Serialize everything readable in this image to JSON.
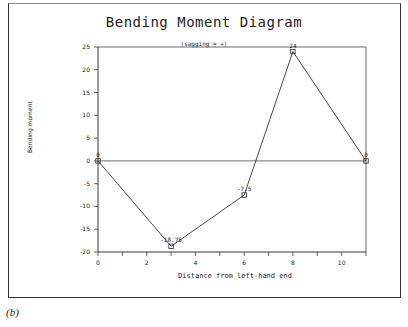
{
  "chart_data": {
    "type": "line",
    "title": "Bending Moment Diagram",
    "subtitle": "(sagging = +)",
    "xlabel": "Distance from left-hand end",
    "ylabel": "Bending moment",
    "x": [
      0,
      3,
      6,
      8,
      11
    ],
    "values": [
      0,
      -18.75,
      -7.5,
      24,
      0
    ],
    "point_labels": [
      "0",
      "-18.75",
      "-7.5",
      "24",
      "0"
    ],
    "xlim": [
      0,
      11
    ],
    "ylim": [
      -20,
      25
    ],
    "xticks": [
      0,
      2,
      4,
      6,
      8,
      10
    ],
    "yticks": [
      25,
      20,
      15,
      10,
      5,
      0,
      -5,
      -10,
      -15,
      -20
    ],
    "grid": false,
    "zero_line": true,
    "marker": "square"
  },
  "caption": "(b)"
}
